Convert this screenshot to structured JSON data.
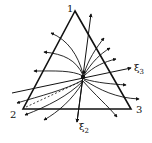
{
  "diagram": {
    "type": "ternary-phase-portrait",
    "vertices": [
      {
        "label": "1",
        "x": 75,
        "y": 11
      },
      {
        "label": "2",
        "x": 23,
        "y": 109
      },
      {
        "label": "3",
        "x": 131,
        "y": 109
      }
    ],
    "node": {
      "x": 83,
      "y": 77
    },
    "axes": {
      "xi3": {
        "symbol": "ξ",
        "subscript": "3"
      },
      "xi2": {
        "symbol": "ξ",
        "subscript": "2"
      }
    },
    "colors": {
      "ink": "#111111",
      "background": "#ffffff"
    }
  }
}
